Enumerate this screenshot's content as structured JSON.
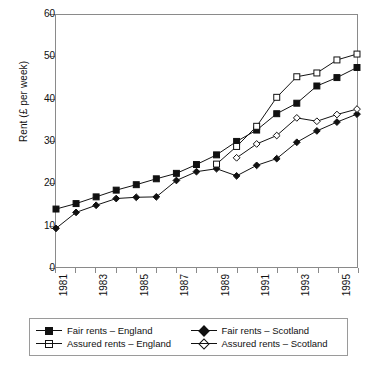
{
  "chart_data": {
    "type": "line",
    "title": "",
    "xlabel": "",
    "ylabel": "Rent (£ per week)",
    "xlim": [
      1981,
      1996
    ],
    "ylim": [
      0,
      60
    ],
    "yticks": [
      0,
      10,
      20,
      30,
      40,
      50,
      60
    ],
    "xticks": [
      1981,
      1982,
      1983,
      1984,
      1985,
      1986,
      1987,
      1988,
      1989,
      1990,
      1991,
      1992,
      1993,
      1994,
      1995,
      1996
    ],
    "xtick_labels": [
      "1981",
      "",
      "1983",
      "",
      "1985",
      "",
      "1987",
      "",
      "1989",
      "",
      "1991",
      "",
      "1993",
      "",
      "1995",
      ""
    ],
    "grid": false,
    "legend_position": "below",
    "series": [
      {
        "name": "Fair rents – England",
        "marker": "filled-square",
        "x": [
          1981,
          1982,
          1983,
          1984,
          1985,
          1986,
          1987,
          1988,
          1989,
          1990,
          1991,
          1992,
          1993,
          1994,
          1995,
          1996
        ],
        "values": [
          13.8,
          15.1,
          16.7,
          18.3,
          19.6,
          21.0,
          22.3,
          24.4,
          26.7,
          29.9,
          32.6,
          36.5,
          39.0,
          43.1,
          45.1,
          47.5
        ]
      },
      {
        "name": "Fair rents – Scotland",
        "marker": "filled-diamond",
        "x": [
          1981,
          1982,
          1983,
          1984,
          1985,
          1986,
          1987,
          1988,
          1989,
          1990,
          1991,
          1992,
          1993,
          1994,
          1995,
          1996
        ],
        "values": [
          9.2,
          13.0,
          14.7,
          16.3,
          16.6,
          16.7,
          20.6,
          22.7,
          23.4,
          21.7,
          24.2,
          25.8,
          29.7,
          32.4,
          34.5,
          36.4
        ]
      },
      {
        "name": "Assured rents – England",
        "marker": "open-square",
        "x": [
          1989,
          1990,
          1991,
          1992,
          1993,
          1994,
          1995,
          1996
        ],
        "values": [
          24.5,
          28.7,
          33.5,
          40.4,
          45.3,
          46.2,
          49.3,
          50.7
        ]
      },
      {
        "name": "Assured rents – Scotland",
        "marker": "open-diamond",
        "x": [
          1990,
          1991,
          1992,
          1993,
          1994,
          1995,
          1996
        ],
        "values": [
          26.0,
          29.3,
          31.3,
          35.5,
          34.7,
          36.3,
          37.6
        ]
      }
    ]
  },
  "legend": {
    "items": [
      {
        "label": "Fair rents – England",
        "marker": "filled-square"
      },
      {
        "label": "Fair rents – Scotland",
        "marker": "filled-diamond"
      },
      {
        "label": "Assured rents – England",
        "marker": "open-square"
      },
      {
        "label": "Assured rents – Scotland",
        "marker": "open-diamond"
      }
    ]
  },
  "colors": {
    "series": "#111111",
    "axis": "#8a8a8a",
    "background": "#ffffff"
  }
}
